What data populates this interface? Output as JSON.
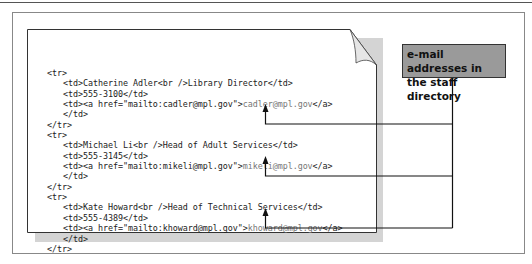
{
  "callout": {
    "label_line1": "e-mail addresses in",
    "label_line2": "the staff directory",
    "fill_color": "#9a9a9a"
  },
  "code_listing": {
    "rows": [
      {
        "open": "<tr>",
        "name_cell": "<td>Catherine Adler<br />Library Director</td>",
        "phone_cell": "<td>555-3100</td>",
        "link_cell_open": "<td><a href=\"mailto:cadler@mpl.gov\">",
        "email": "cadler@mpl.gov",
        "link_cell_close": "</a>",
        "td_close": "</td>",
        "close": "</tr>"
      },
      {
        "open": "<tr>",
        "name_cell": "<td>Michael Li<br />Head of Adult Services</td>",
        "phone_cell": "<td>555-3145</td>",
        "link_cell_open": "<td><a href=\"mailto:mikeli@mpl.gov\">",
        "email": "mikeli@mpl.gov",
        "link_cell_close": "</a>",
        "td_close": "</td>",
        "close": "</tr>"
      },
      {
        "open": "<tr>",
        "name_cell": "<td>Kate Howard<br />Head of Technical Services</td>",
        "phone_cell": "<td>555-4389</td>",
        "link_cell_open": "<td><a href=\"mailto:khoward@mpl.gov\">",
        "email": "khoward@mpl.gov",
        "link_cell_close": "</a>",
        "td_close": "</td>",
        "close": "</tr>"
      }
    ]
  }
}
